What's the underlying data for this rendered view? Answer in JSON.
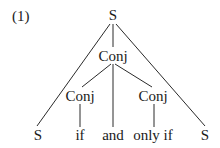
{
  "example_number": "(1)",
  "tree": {
    "root": {
      "label": "S",
      "x": 113,
      "y": 15
    },
    "nodes": [
      {
        "id": "conj_mid",
        "label": "Conj",
        "x": 113,
        "y": 56
      },
      {
        "id": "conj_left",
        "label": "Conj",
        "x": 80,
        "y": 96
      },
      {
        "id": "conj_right",
        "label": "Conj",
        "x": 153,
        "y": 96
      }
    ],
    "leaves": [
      {
        "id": "leaf_s_left",
        "label": "S",
        "x": 38,
        "y": 135
      },
      {
        "id": "leaf_if",
        "label": "if",
        "x": 80,
        "y": 135
      },
      {
        "id": "leaf_and",
        "label": "and",
        "x": 113,
        "y": 135
      },
      {
        "id": "leaf_only_if",
        "label": "only if",
        "x": 153,
        "y": 135
      },
      {
        "id": "leaf_s_right",
        "label": "S",
        "x": 205,
        "y": 135
      }
    ],
    "edges": [
      {
        "from": "root",
        "to": "leaf_s_left"
      },
      {
        "from": "root",
        "to": "conj_mid"
      },
      {
        "from": "root",
        "to": "leaf_s_right"
      },
      {
        "from": "conj_mid",
        "to": "conj_left"
      },
      {
        "from": "conj_mid",
        "to": "leaf_and"
      },
      {
        "from": "conj_mid",
        "to": "conj_right"
      },
      {
        "from": "conj_left",
        "to": "leaf_if"
      },
      {
        "from": "conj_right",
        "to": "leaf_only_if"
      }
    ]
  }
}
